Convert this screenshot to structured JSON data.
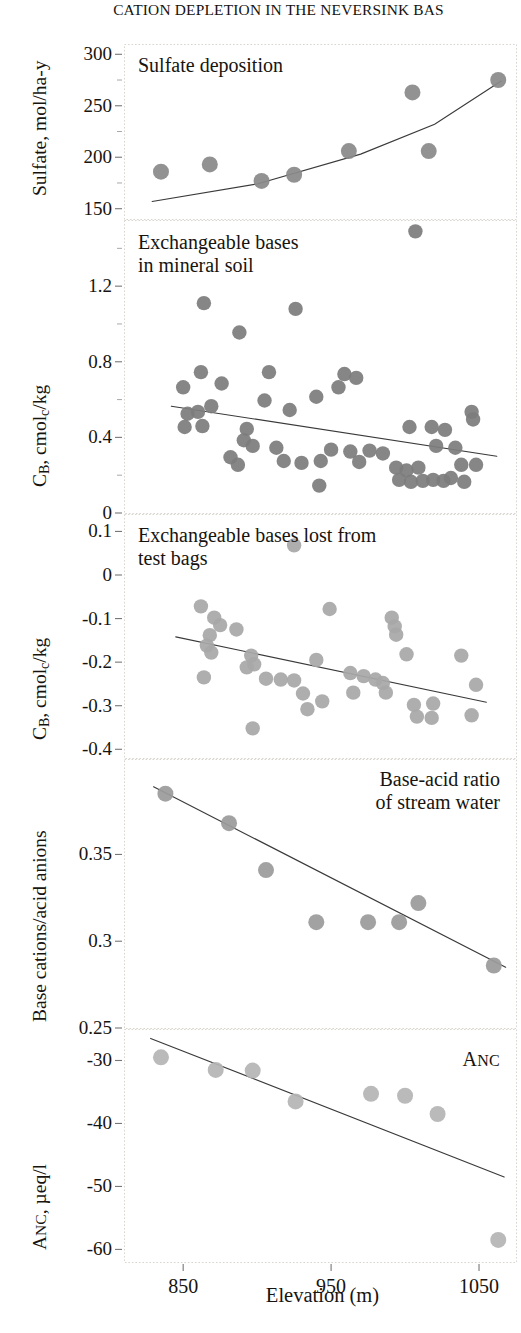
{
  "title": "CATION DEPLETION IN THE NEVERSINK BAS",
  "xaxis": {
    "label": "Elevation (m)",
    "ticks": [
      850,
      950,
      1050
    ],
    "range": [
      810,
      1075
    ]
  },
  "panels": [
    {
      "name": "sulfate-deposition",
      "caption": "Sulfate deposition",
      "caption_align": "left",
      "ylabel_html": "Sulfate, mol/ha-y",
      "yticks": [
        150,
        200,
        250,
        300
      ],
      "ylim": [
        140,
        310
      ],
      "minor_ticks": [
        175,
        225,
        275
      ]
    },
    {
      "name": "exchangeable-bases-mineral-soil",
      "caption": "Exchangeable bases\nin mineral soil",
      "caption_align": "left",
      "ylabel_html": "CB, cmolc/kg",
      "yticks": [
        0,
        0.4,
        0.8,
        1.2
      ],
      "ylim": [
        0,
        1.55
      ],
      "minor_ticks": [
        0.2,
        0.6,
        1.0,
        1.4
      ]
    },
    {
      "name": "exchangeable-bases-test-bags",
      "caption": "Exchangeable bases lost from\ntest bags",
      "caption_align": "left",
      "ylabel_html": "CB, cmolc/kg",
      "yticks": [
        0.1,
        0,
        -0.1,
        -0.2,
        -0.3,
        -0.4
      ],
      "ylim": [
        -0.42,
        0.14
      ],
      "minor_ticks": []
    },
    {
      "name": "base-acid-ratio-stream-water",
      "caption": "Base-acid ratio\nof stream water",
      "caption_align": "right",
      "ylabel_html": "Base cations/acid anions",
      "yticks": [
        0.25,
        0.3,
        0.35
      ],
      "ylim": [
        0.25,
        0.405
      ],
      "minor_ticks": []
    },
    {
      "name": "anc",
      "caption": "ANC",
      "caption_align": "right",
      "ylabel_html": "ANC, µeq/l",
      "yticks": [
        -30,
        -40,
        -50,
        -60
      ],
      "ylim": [
        -62,
        -25
      ],
      "minor_ticks": []
    }
  ],
  "chart_data": [
    {
      "type": "scatter",
      "title": "Sulfate deposition",
      "xlabel": "Elevation (m)",
      "ylabel": "Sulfate, mol/ha-y",
      "xlim": [
        810,
        1075
      ],
      "ylim": [
        140,
        310
      ],
      "grid": false,
      "marker_color": "#8a8a8a",
      "trend": "curve",
      "points": [
        {
          "x": 835,
          "y": 186
        },
        {
          "x": 868,
          "y": 193
        },
        {
          "x": 903,
          "y": 177
        },
        {
          "x": 925,
          "y": 183
        },
        {
          "x": 962,
          "y": 206
        },
        {
          "x": 1005,
          "y": 263
        },
        {
          "x": 1016,
          "y": 206
        },
        {
          "x": 1063,
          "y": 275
        }
      ],
      "trendline": [
        {
          "x": 829,
          "y": 157
        },
        {
          "x": 900,
          "y": 174
        },
        {
          "x": 970,
          "y": 203
        },
        {
          "x": 1020,
          "y": 232
        },
        {
          "x": 1065,
          "y": 274
        }
      ]
    },
    {
      "type": "scatter",
      "title": "Exchangeable bases in mineral soil",
      "xlabel": "Elevation (m)",
      "ylabel": "CB, cmolc/kg",
      "xlim": [
        810,
        1075
      ],
      "ylim": [
        0,
        1.55
      ],
      "grid": false,
      "marker_color": "#7d7d7d",
      "trend": "linear",
      "points": [
        {
          "x": 1007,
          "y": 1.49
        },
        {
          "x": 864,
          "y": 1.11
        },
        {
          "x": 926,
          "y": 1.08
        },
        {
          "x": 888,
          "y": 0.955
        },
        {
          "x": 862,
          "y": 0.745
        },
        {
          "x": 908,
          "y": 0.745
        },
        {
          "x": 959,
          "y": 0.735
        },
        {
          "x": 967,
          "y": 0.715
        },
        {
          "x": 850,
          "y": 0.665
        },
        {
          "x": 876,
          "y": 0.685
        },
        {
          "x": 955,
          "y": 0.665
        },
        {
          "x": 869,
          "y": 0.565
        },
        {
          "x": 905,
          "y": 0.595
        },
        {
          "x": 940,
          "y": 0.615
        },
        {
          "x": 1045,
          "y": 0.535
        },
        {
          "x": 853,
          "y": 0.525
        },
        {
          "x": 860,
          "y": 0.535
        },
        {
          "x": 922,
          "y": 0.545
        },
        {
          "x": 1046,
          "y": 0.495
        },
        {
          "x": 851,
          "y": 0.455
        },
        {
          "x": 863,
          "y": 0.46
        },
        {
          "x": 893,
          "y": 0.445
        },
        {
          "x": 1003,
          "y": 0.455
        },
        {
          "x": 1018,
          "y": 0.455
        },
        {
          "x": 1027,
          "y": 0.44
        },
        {
          "x": 891,
          "y": 0.385
        },
        {
          "x": 897,
          "y": 0.355
        },
        {
          "x": 913,
          "y": 0.345
        },
        {
          "x": 1021,
          "y": 0.355
        },
        {
          "x": 1034,
          "y": 0.345
        },
        {
          "x": 950,
          "y": 0.335
        },
        {
          "x": 963,
          "y": 0.325
        },
        {
          "x": 976,
          "y": 0.33
        },
        {
          "x": 985,
          "y": 0.315
        },
        {
          "x": 882,
          "y": 0.295
        },
        {
          "x": 887,
          "y": 0.255
        },
        {
          "x": 918,
          "y": 0.275
        },
        {
          "x": 930,
          "y": 0.265
        },
        {
          "x": 943,
          "y": 0.275
        },
        {
          "x": 969,
          "y": 0.27
        },
        {
          "x": 994,
          "y": 0.24
        },
        {
          "x": 1001,
          "y": 0.225
        },
        {
          "x": 1009,
          "y": 0.24
        },
        {
          "x": 1038,
          "y": 0.255
        },
        {
          "x": 1048,
          "y": 0.255
        },
        {
          "x": 996,
          "y": 0.175
        },
        {
          "x": 1004,
          "y": 0.165
        },
        {
          "x": 1012,
          "y": 0.17
        },
        {
          "x": 1019,
          "y": 0.175
        },
        {
          "x": 1026,
          "y": 0.17
        },
        {
          "x": 1031,
          "y": 0.185
        },
        {
          "x": 1040,
          "y": 0.165
        },
        {
          "x": 942,
          "y": 0.145
        }
      ],
      "trendline": [
        {
          "x": 842,
          "y": 0.565
        },
        {
          "x": 1062,
          "y": 0.3
        }
      ]
    },
    {
      "type": "scatter",
      "title": "Exchangeable bases lost from test bags",
      "xlabel": "Elevation (m)",
      "ylabel": "CB, cmolc/kg",
      "xlim": [
        810,
        1075
      ],
      "ylim": [
        -0.42,
        0.14
      ],
      "grid": false,
      "marker_color": "#a8a8a8",
      "trend": "linear",
      "points": [
        {
          "x": 925,
          "y": 0.068
        },
        {
          "x": 862,
          "y": -0.072
        },
        {
          "x": 949,
          "y": -0.078
        },
        {
          "x": 871,
          "y": -0.098
        },
        {
          "x": 991,
          "y": -0.098
        },
        {
          "x": 875,
          "y": -0.115
        },
        {
          "x": 993,
          "y": -0.118
        },
        {
          "x": 886,
          "y": -0.125
        },
        {
          "x": 868,
          "y": -0.138
        },
        {
          "x": 994,
          "y": -0.137
        },
        {
          "x": 866,
          "y": -0.162
        },
        {
          "x": 869,
          "y": -0.178
        },
        {
          "x": 1038,
          "y": -0.185
        },
        {
          "x": 896,
          "y": -0.185
        },
        {
          "x": 1001,
          "y": -0.182
        },
        {
          "x": 898,
          "y": -0.205
        },
        {
          "x": 940,
          "y": -0.195
        },
        {
          "x": 893,
          "y": -0.212
        },
        {
          "x": 864,
          "y": -0.235
        },
        {
          "x": 906,
          "y": -0.238
        },
        {
          "x": 916,
          "y": -0.24
        },
        {
          "x": 925,
          "y": -0.242
        },
        {
          "x": 963,
          "y": -0.225
        },
        {
          "x": 972,
          "y": -0.232
        },
        {
          "x": 980,
          "y": -0.24
        },
        {
          "x": 985,
          "y": -0.248
        },
        {
          "x": 1048,
          "y": -0.252
        },
        {
          "x": 931,
          "y": -0.272
        },
        {
          "x": 965,
          "y": -0.27
        },
        {
          "x": 987,
          "y": -0.27
        },
        {
          "x": 944,
          "y": -0.29
        },
        {
          "x": 1006,
          "y": -0.298
        },
        {
          "x": 1019,
          "y": -0.295
        },
        {
          "x": 934,
          "y": -0.308
        },
        {
          "x": 1008,
          "y": -0.325
        },
        {
          "x": 1018,
          "y": -0.328
        },
        {
          "x": 1045,
          "y": -0.322
        },
        {
          "x": 897,
          "y": -0.352
        }
      ],
      "trendline": [
        {
          "x": 845,
          "y": -0.142
        },
        {
          "x": 1055,
          "y": -0.292
        }
      ]
    },
    {
      "type": "scatter",
      "title": "Base-acid ratio of stream water",
      "xlabel": "Elevation (m)",
      "ylabel": "Base cations/acid anions",
      "xlim": [
        810,
        1075
      ],
      "ylim": [
        0.25,
        0.405
      ],
      "grid": false,
      "marker_color": "#9b9b9b",
      "trend": "linear",
      "points": [
        {
          "x": 838,
          "y": 0.385
        },
        {
          "x": 881,
          "y": 0.368
        },
        {
          "x": 906,
          "y": 0.341
        },
        {
          "x": 1009,
          "y": 0.322
        },
        {
          "x": 940,
          "y": 0.311
        },
        {
          "x": 975,
          "y": 0.311
        },
        {
          "x": 996,
          "y": 0.311
        },
        {
          "x": 1060,
          "y": 0.286
        }
      ],
      "trendline": [
        {
          "x": 830,
          "y": 0.389
        },
        {
          "x": 1068,
          "y": 0.285
        }
      ]
    },
    {
      "type": "scatter",
      "title": "ANC",
      "xlabel": "Elevation (m)",
      "ylabel": "ANC, µeq/l",
      "xlim": [
        810,
        1075
      ],
      "ylim": [
        -62,
        -25
      ],
      "grid": false,
      "marker_color": "#b5b5b5",
      "trend": "linear",
      "points": [
        {
          "x": 835,
          "y": -29.5
        },
        {
          "x": 872,
          "y": -31.5
        },
        {
          "x": 897,
          "y": -31.6
        },
        {
          "x": 926,
          "y": -36.5
        },
        {
          "x": 977,
          "y": -35.3
        },
        {
          "x": 1000,
          "y": -35.6
        },
        {
          "x": 1022,
          "y": -38.5
        },
        {
          "x": 1063,
          "y": -58.5
        }
      ],
      "trendline": [
        {
          "x": 828,
          "y": -26.5
        },
        {
          "x": 1067,
          "y": -48.5
        }
      ]
    }
  ]
}
